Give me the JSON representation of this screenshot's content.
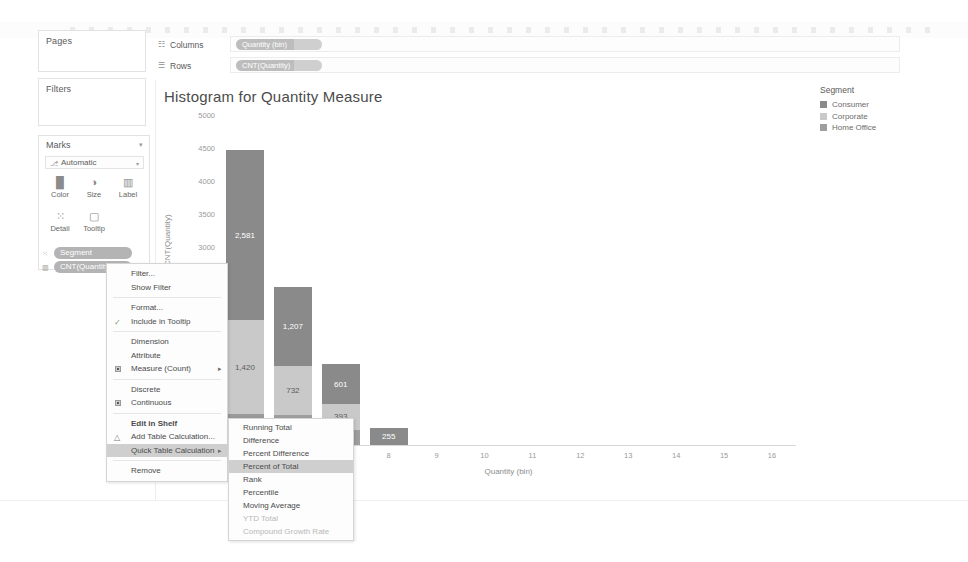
{
  "app": {
    "accent_dark": "#808080",
    "accent_mid": "#c4c4c4",
    "accent_low": "#9e9e9e",
    "pill_color": "#b4b4b4"
  },
  "panes": {
    "pages_title": "Pages",
    "filters_title": "Filters",
    "marks_title": "Marks",
    "marks_caret": "▾",
    "marks_type": {
      "label": "Automatic",
      "glyph": "⎇",
      "caret": "▾"
    },
    "marks_buttons_row1": [
      {
        "label": "Color",
        "icon_glyph": "█",
        "icon_name": "color-icon"
      },
      {
        "label": "Size",
        "icon_glyph": "◑",
        "icon_name": "size-icon"
      },
      {
        "label": "Label",
        "icon_glyph": "▥",
        "icon_name": "label-icon"
      }
    ],
    "marks_buttons_row2": [
      {
        "label": "Detail",
        "icon_glyph": "⁙",
        "icon_name": "detail-icon"
      },
      {
        "label": "Tooltip",
        "icon_glyph": "▢",
        "icon_name": "tooltip-icon"
      }
    ],
    "marks_pills": [
      {
        "label": "Segment",
        "icon_glyph": "⁙",
        "icon_name": "detail-pill-icon"
      },
      {
        "label": "CNT(Quantity)",
        "icon_glyph": "▥",
        "icon_name": "label-pill-icon"
      }
    ]
  },
  "shelves": {
    "columns": {
      "label": "Columns",
      "glyph": "☷",
      "pill": "Quantity (bin)"
    },
    "rows": {
      "label": "Rows",
      "glyph": "☰",
      "pill": "CNT(Quantity)"
    }
  },
  "chart_data": {
    "type": "bar",
    "title": "Histogram for Quantity Measure",
    "xlabel": "Quantity (bin)",
    "ylabel": "CNT(Quantity)",
    "ylim": [
      0,
      5000
    ],
    "yticks": [
      5000,
      4500,
      4000,
      3500,
      3000
    ],
    "grid": false,
    "legend_position": "right",
    "categories": [
      "5",
      "6",
      "7",
      "8",
      "9",
      "10",
      "11",
      "12",
      "13",
      "14",
      "15",
      "16"
    ],
    "stacked": true,
    "series": [
      {
        "name": "Consumer",
        "color": "#8a8a8a",
        "values": [
          2581,
          1207,
          601,
          255,
          0,
          0,
          0,
          0,
          0,
          0,
          0,
          0
        ]
      },
      {
        "name": "Corporate",
        "color": "#c9c9c9",
        "values": [
          1420,
          732,
          393,
          0,
          0,
          0,
          0,
          0,
          0,
          0,
          0,
          0
        ]
      },
      {
        "name": "Home Office",
        "color": "#9e9e9e",
        "values": [
          471,
          462,
          228,
          0,
          0,
          0,
          0,
          0,
          0,
          0,
          0,
          0
        ]
      }
    ],
    "bars": [
      {
        "category": "5",
        "segments": [
          {
            "series": "Consumer",
            "value": 2581,
            "label": "2,581",
            "color": "#8a8a8a"
          },
          {
            "series": "Corporate",
            "value": 1420,
            "label": "1,420",
            "color": "#c9c9c9"
          },
          {
            "series": "Home Office",
            "value": 471,
            "label": "471",
            "color": "#9a9a9a"
          }
        ]
      },
      {
        "category": "6",
        "segments": [
          {
            "series": "Consumer",
            "value": 1207,
            "label": "1,207",
            "color": "#8a8a8a"
          },
          {
            "series": "Corporate",
            "value": 732,
            "label": "732",
            "color": "#c9c9c9"
          },
          {
            "series": "Home Office",
            "value": 462,
            "label": "462",
            "color": "#9e9e9e"
          }
        ]
      },
      {
        "category": "7",
        "segments": [
          {
            "series": "Consumer",
            "value": 601,
            "label": "601",
            "color": "#8a8a8a"
          },
          {
            "series": "Corporate",
            "value": 393,
            "label": "393",
            "color": "#c9c9c9"
          },
          {
            "series": "Home Office",
            "value": 228,
            "label": "228",
            "color": "#9e9e9e"
          }
        ]
      },
      {
        "category": "8",
        "segments": [
          {
            "series": "Consumer",
            "value": 255,
            "label": "255",
            "color": "#8a8a8a"
          }
        ]
      }
    ]
  },
  "legend": {
    "title": "Segment",
    "items": [
      {
        "label": "Consumer",
        "color": "#8a8a8a"
      },
      {
        "label": "Corporate",
        "color": "#c9c9c9"
      },
      {
        "label": "Home Office",
        "color": "#9e9e9e"
      }
    ]
  },
  "context_menu": {
    "items": [
      {
        "label": "Filter...",
        "type": "normal"
      },
      {
        "label": "Show Filter",
        "type": "normal"
      },
      {
        "separator_before": true,
        "label": "Format...",
        "type": "normal"
      },
      {
        "label": "Include in Tooltip",
        "type": "check",
        "checked": true,
        "check_glyph": "✓"
      },
      {
        "separator_before": true,
        "label": "Dimension",
        "type": "normal"
      },
      {
        "label": "Attribute",
        "type": "normal"
      },
      {
        "label": "Measure (Count)",
        "type": "radio",
        "selected": true,
        "submenu": true,
        "arrow": "▸"
      },
      {
        "separator_before": true,
        "label": "Discrete",
        "type": "normal"
      },
      {
        "label": "Continuous",
        "type": "radio",
        "selected": true
      },
      {
        "separator_before": true,
        "label": "Edit in Shelf",
        "type": "bold"
      },
      {
        "label": "Add Table Calculation...",
        "type": "glyph",
        "glyph": "△"
      },
      {
        "label": "Quick Table Calculation",
        "type": "normal",
        "highlighted": true,
        "submenu": true,
        "arrow": "▸"
      },
      {
        "separator_before": true,
        "label": "Remove",
        "type": "normal"
      }
    ]
  },
  "submenu": {
    "items": [
      {
        "label": "Running Total",
        "state": "normal"
      },
      {
        "label": "Difference",
        "state": "normal"
      },
      {
        "label": "Percent Difference",
        "state": "normal"
      },
      {
        "label": "Percent of Total",
        "state": "highlighted"
      },
      {
        "label": "Rank",
        "state": "normal"
      },
      {
        "label": "Percentile",
        "state": "normal"
      },
      {
        "label": "Moving Average",
        "state": "normal"
      },
      {
        "label": "YTD Total",
        "state": "disabled"
      },
      {
        "label": "Compound Growth Rate",
        "state": "disabled"
      }
    ]
  },
  "status_bar": {
    "summary": "NT(Quantity): 10,194",
    "icons": [
      {
        "name": "data-source-icon",
        "glyph": "⌸"
      },
      {
        "name": "sheet-icon",
        "glyph": "⌷"
      }
    ],
    "nav": [
      {
        "name": "first-page-icon",
        "glyph": "|◂"
      },
      {
        "name": "prev-page-icon",
        "glyph": "◂"
      },
      {
        "name": "next-page-icon",
        "glyph": "▸"
      },
      {
        "name": "last-page-icon",
        "glyph": "▸|"
      },
      {
        "name": "show-me-icon",
        "glyph": "⌗"
      },
      {
        "name": "grid-icon",
        "glyph": "▤"
      }
    ]
  }
}
